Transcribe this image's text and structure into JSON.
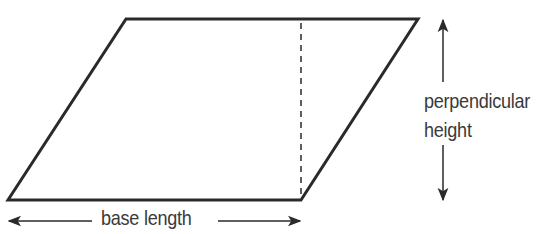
{
  "diagram": {
    "shape": "parallelogram",
    "colors": {
      "stroke": "#2a2a2a",
      "text": "#3a3a3a",
      "background": "#ffffff"
    },
    "labels": {
      "base": "base length",
      "height_line1": "perpendicular",
      "height_line2": "height"
    }
  }
}
